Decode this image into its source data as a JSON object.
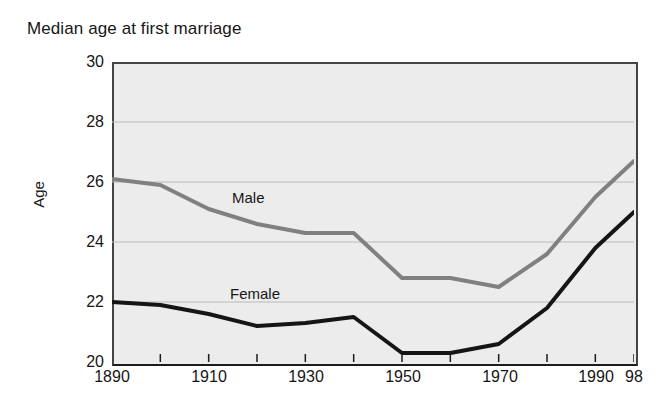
{
  "chart_data": {
    "type": "line",
    "title": "Median age at first marriage",
    "xlabel": "",
    "ylabel": "Age",
    "ylim": [
      20,
      30
    ],
    "xlim": [
      1890,
      1998
    ],
    "yticks": [
      20,
      22,
      24,
      26,
      28,
      30
    ],
    "ytick_labels": [
      "20",
      "22",
      "24",
      "26",
      "28",
      "30"
    ],
    "xticks": [
      1890,
      1900,
      1910,
      1920,
      1930,
      1940,
      1950,
      1960,
      1970,
      1980,
      1990,
      1998
    ],
    "xtick_labels": [
      "1890",
      "1910",
      "1930",
      "1950",
      "1970",
      "1990",
      "98"
    ],
    "xtick_label_values": [
      1890,
      1910,
      1930,
      1950,
      1970,
      1990,
      1998
    ],
    "grid": "horizontal",
    "legend": "inline-annotations",
    "x": [
      1890,
      1900,
      1910,
      1920,
      1930,
      1940,
      1950,
      1960,
      1970,
      1980,
      1990,
      1998
    ],
    "series": [
      {
        "name": "Male",
        "color": "#808080",
        "values": [
          26.1,
          25.9,
          25.1,
          24.6,
          24.3,
          24.3,
          22.8,
          22.8,
          22.5,
          23.6,
          25.5,
          26.7
        ]
      },
      {
        "name": "Female",
        "color": "#151515",
        "values": [
          22.0,
          21.9,
          21.6,
          21.2,
          21.3,
          21.5,
          20.3,
          20.3,
          20.6,
          21.8,
          23.8,
          25.0
        ]
      }
    ],
    "annotations": [
      {
        "text": "Male",
        "x": 1940,
        "y": 25.2
      },
      {
        "text": "Female",
        "x": 1938,
        "y": 22.1
      }
    ],
    "colors": {
      "plot_background": "#ececec",
      "page_background": "#ffffff",
      "axis": "#1c1c1c",
      "gridline": "#b9b9b9",
      "male_line": "#808080",
      "female_line": "#151515",
      "text": "#161616"
    }
  }
}
